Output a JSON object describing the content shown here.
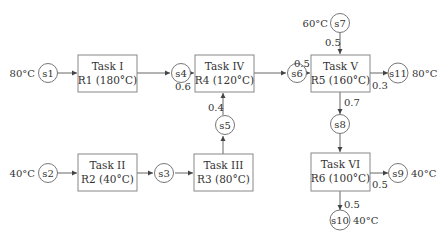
{
  "diagram": {
    "tasks": [
      {
        "id": "task1",
        "line1": "Task I",
        "line2": "R1 (180°C)"
      },
      {
        "id": "task2",
        "line1": "Task II",
        "line2": "R2 (40°C)"
      },
      {
        "id": "task3",
        "line1": "Task III",
        "line2": "R3 (80°C)"
      },
      {
        "id": "task4",
        "line1": "Task IV",
        "line2": "R4 (120°C)"
      },
      {
        "id": "task5",
        "line1": "Task V",
        "line2": "R5 (160°C)"
      },
      {
        "id": "task6",
        "line1": "Task VI",
        "line2": "R6 (100°C)"
      }
    ],
    "states": [
      {
        "id": "s1",
        "label": "s1",
        "temp": "80°C"
      },
      {
        "id": "s2",
        "label": "s2",
        "temp": "40°C"
      },
      {
        "id": "s3",
        "label": "s3"
      },
      {
        "id": "s4",
        "label": "s4"
      },
      {
        "id": "s5",
        "label": "s5"
      },
      {
        "id": "s6",
        "label": "s6"
      },
      {
        "id": "s7",
        "label": "s7",
        "temp": "60°C"
      },
      {
        "id": "s8",
        "label": "s8"
      },
      {
        "id": "s9",
        "label": "s9",
        "temp": "40°C"
      },
      {
        "id": "s10",
        "label": "s10",
        "temp": "40°C"
      },
      {
        "id": "s11",
        "label": "s11",
        "temp": "80°C"
      }
    ],
    "fractions": {
      "s4_to_task4": "0.6",
      "s5_to_task4": "0.4",
      "s6_to_task5": "0.5",
      "s7_to_task5": "0.5",
      "task5_to_s11": "0.3",
      "task5_to_s8": "0.7",
      "task6_to_s9": "0.5",
      "task6_to_s10": "0.5"
    }
  }
}
